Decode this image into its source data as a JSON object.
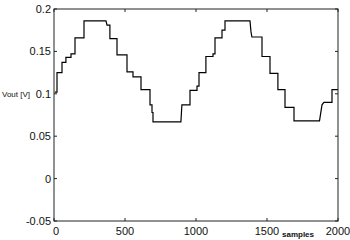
{
  "chart_data": {
    "type": "line",
    "title": "",
    "xlabel": "samples",
    "ylabel": "Vout [V]",
    "xlim": [
      0,
      2000
    ],
    "ylim": [
      -0.05,
      0.2
    ],
    "grid": false,
    "legend": null,
    "x_ticks": [
      0,
      500,
      1000,
      1500,
      2000
    ],
    "x_tick_labels": [
      "0",
      "500",
      "1000",
      "1500",
      "2000"
    ],
    "y_ticks": [
      -0.05,
      0,
      0.05,
      0.1,
      0.15,
      0.2
    ],
    "y_tick_labels": [
      "-0.05",
      "0",
      "0.05",
      "0.1",
      "0.15",
      "0.2"
    ],
    "series": [
      {
        "name": "Vout",
        "color": "#000000",
        "style": "staircase",
        "points": [
          [
            5,
            0.102
          ],
          [
            21,
            0.102
          ],
          [
            21,
            0.125
          ],
          [
            56,
            0.125
          ],
          [
            56,
            0.137
          ],
          [
            84,
            0.137
          ],
          [
            84,
            0.143
          ],
          [
            120,
            0.143
          ],
          [
            120,
            0.147
          ],
          [
            148,
            0.147
          ],
          [
            148,
            0.166
          ],
          [
            211,
            0.166
          ],
          [
            211,
            0.186
          ],
          [
            366,
            0.186
          ],
          [
            373,
            0.181
          ],
          [
            394,
            0.181
          ],
          [
            394,
            0.165
          ],
          [
            444,
            0.165
          ],
          [
            444,
            0.146
          ],
          [
            514,
            0.146
          ],
          [
            514,
            0.126
          ],
          [
            556,
            0.126
          ],
          [
            556,
            0.12
          ],
          [
            613,
            0.12
          ],
          [
            613,
            0.105
          ],
          [
            676,
            0.105
          ],
          [
            676,
            0.087
          ],
          [
            690,
            0.087
          ],
          [
            690,
            0.078
          ],
          [
            697,
            0.078
          ],
          [
            697,
            0.067
          ],
          [
            894,
            0.067
          ],
          [
            901,
            0.087
          ],
          [
            958,
            0.087
          ],
          [
            958,
            0.104
          ],
          [
            1007,
            0.104
          ],
          [
            1007,
            0.109
          ],
          [
            1021,
            0.109
          ],
          [
            1021,
            0.125
          ],
          [
            1070,
            0.125
          ],
          [
            1070,
            0.144
          ],
          [
            1120,
            0.144
          ],
          [
            1120,
            0.147
          ],
          [
            1134,
            0.147
          ],
          [
            1134,
            0.166
          ],
          [
            1183,
            0.166
          ],
          [
            1183,
            0.175
          ],
          [
            1204,
            0.175
          ],
          [
            1204,
            0.186
          ],
          [
            1380,
            0.186
          ],
          [
            1387,
            0.173
          ],
          [
            1394,
            0.167
          ],
          [
            1465,
            0.167
          ],
          [
            1465,
            0.144
          ],
          [
            1521,
            0.144
          ],
          [
            1521,
            0.124
          ],
          [
            1577,
            0.124
          ],
          [
            1577,
            0.105
          ],
          [
            1627,
            0.105
          ],
          [
            1627,
            0.084
          ],
          [
            1690,
            0.084
          ],
          [
            1690,
            0.068
          ],
          [
            1870,
            0.068
          ],
          [
            1887,
            0.087
          ],
          [
            1901,
            0.09
          ],
          [
            1958,
            0.09
          ],
          [
            1958,
            0.105
          ],
          [
            2000,
            0.105
          ]
        ]
      }
    ]
  }
}
